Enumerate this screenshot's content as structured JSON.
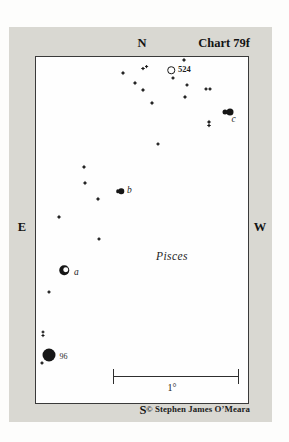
{
  "colors": {
    "page_bg": "#fdfdfc",
    "panel_bg": "#d9d8d2",
    "chart_bg": "#fefefe",
    "ink": "#161616",
    "border": "#3a3a3a"
  },
  "frame": {
    "north": "N",
    "south": "S",
    "east": "E",
    "west": "W",
    "title": "Chart 79f",
    "copyright": "© Stephen James O’Meara"
  },
  "scale_bar": {
    "label": "1°"
  },
  "chart_data": {
    "type": "star-map",
    "constellation": "Pisces",
    "labels": [
      {
        "text": "524",
        "x": 178,
        "y": 65,
        "cls": "lbl-num-bold"
      },
      {
        "text": "c",
        "x": 231.5,
        "y": 115,
        "cls": "lbl-italic"
      },
      {
        "text": "b",
        "x": 127,
        "y": 185.5,
        "cls": "lbl-italic"
      },
      {
        "text": "a",
        "x": 74,
        "y": 267.5,
        "cls": "lbl-italic"
      },
      {
        "text": "96",
        "x": 59.5,
        "y": 352.5,
        "cls": "lbl-num"
      },
      {
        "text": "Pisces",
        "x": 156,
        "y": 250.5,
        "cls": "lbl-constellation"
      }
    ],
    "stars": [
      {
        "type": "star4",
        "x": 184,
        "y": 60,
        "size": 5,
        "name": "field-star"
      },
      {
        "type": "star4",
        "x": 123,
        "y": 73,
        "size": 5,
        "name": "field-star"
      },
      {
        "type": "star4",
        "x": 143,
        "y": 68.5,
        "size": 4.5,
        "name": "field-star-pair-west"
      },
      {
        "type": "star4",
        "x": 146.5,
        "y": 66.5,
        "size": 4,
        "name": "field-star-pair-east"
      },
      {
        "type": "star4",
        "x": 135,
        "y": 83,
        "size": 5,
        "name": "field-star"
      },
      {
        "type": "star4",
        "x": 143,
        "y": 90,
        "size": 5,
        "name": "field-star"
      },
      {
        "type": "star4",
        "x": 173,
        "y": 78,
        "size": 4.5,
        "name": "star-below-524"
      },
      {
        "type": "star4",
        "x": 187,
        "y": 85,
        "size": 4.5,
        "name": "field-star"
      },
      {
        "type": "star4",
        "x": 185,
        "y": 97,
        "size": 5,
        "name": "field-star"
      },
      {
        "type": "star4",
        "x": 206,
        "y": 89,
        "size": 4.5,
        "name": "field-star-pair-west"
      },
      {
        "type": "star4",
        "x": 210,
        "y": 89,
        "size": 4.5,
        "name": "field-star-pair-east"
      },
      {
        "type": "star4",
        "x": 152,
        "y": 103,
        "size": 5,
        "name": "field-star"
      },
      {
        "type": "star4",
        "x": 209,
        "y": 122,
        "size": 5,
        "name": "field-star-pair-north"
      },
      {
        "type": "star4",
        "x": 209,
        "y": 125.5,
        "size": 4.5,
        "name": "field-star-pair-south"
      },
      {
        "type": "star4",
        "x": 158,
        "y": 144,
        "size": 4.5,
        "name": "field-star"
      },
      {
        "type": "star4",
        "x": 84,
        "y": 167,
        "size": 5,
        "name": "field-star"
      },
      {
        "type": "star4",
        "x": 85,
        "y": 183,
        "size": 5,
        "name": "field-star"
      },
      {
        "type": "star4",
        "x": 98,
        "y": 199,
        "size": 5,
        "name": "field-star"
      },
      {
        "type": "star4",
        "x": 59,
        "y": 217,
        "size": 5,
        "name": "field-star"
      },
      {
        "type": "star4",
        "x": 99,
        "y": 239,
        "size": 4.5,
        "name": "field-star"
      },
      {
        "type": "star4",
        "x": 49,
        "y": 292,
        "size": 4.5,
        "name": "field-star"
      },
      {
        "type": "star4",
        "x": 43,
        "y": 332,
        "size": 4,
        "name": "field-star-pair-north"
      },
      {
        "type": "star4",
        "x": 43,
        "y": 335.5,
        "size": 4,
        "name": "field-star-pair-south"
      },
      {
        "type": "star4",
        "x": 42,
        "y": 363,
        "size": 4.5,
        "name": "field-star"
      },
      {
        "type": "ring",
        "x": 171,
        "y": 70,
        "size": 7.5,
        "name": "object-524"
      },
      {
        "type": "dot",
        "x": 117.5,
        "y": 191,
        "size": 3.5,
        "name": "star-b-companion"
      },
      {
        "type": "dot",
        "x": 121,
        "y": 191,
        "size": 5.5,
        "name": "star-b"
      },
      {
        "type": "dot",
        "x": 224.5,
        "y": 112,
        "size": 5,
        "name": "star-c-companion"
      },
      {
        "type": "dot",
        "x": 229.5,
        "y": 112,
        "size": 7,
        "name": "star-c"
      },
      {
        "type": "crescent",
        "x": 64,
        "y": 270,
        "size": 9.5,
        "name": "star-a"
      },
      {
        "type": "dot",
        "x": 49,
        "y": 355,
        "size": 13,
        "name": "star-96"
      }
    ]
  }
}
